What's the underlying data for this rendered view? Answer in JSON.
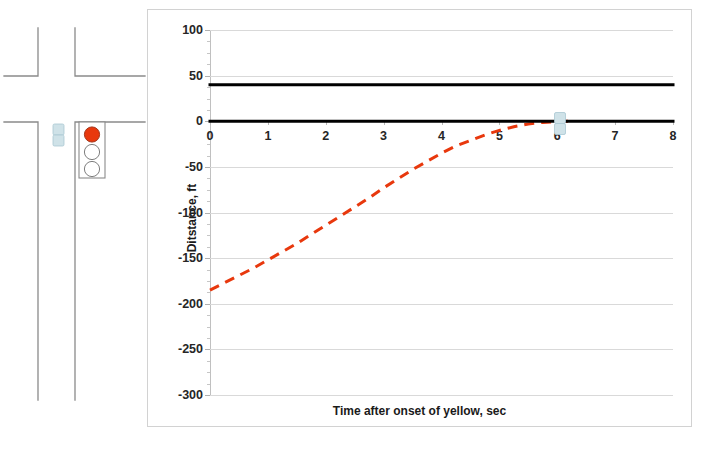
{
  "scene": {
    "name": "signalized-intersection-sketch",
    "signal": {
      "name": "traffic-signal-head",
      "lamps": [
        {
          "name": "red-lamp",
          "state": "on",
          "color": "#E8380D"
        },
        {
          "name": "yellow-lamp",
          "state": "off",
          "color": "#ffffff"
        },
        {
          "name": "green-lamp",
          "state": "off",
          "color": "#ffffff"
        }
      ]
    },
    "vehicles": [
      {
        "name": "vehicle-at-stop-line",
        "color": "#BFD9E0"
      }
    ],
    "road_color": "#8a8a8a"
  },
  "chart_data": {
    "type": "line",
    "title": "",
    "xlabel": "Time after onset of yellow, sec",
    "ylabel": "Ditstance, ft",
    "xlim": [
      0,
      8
    ],
    "ylim": [
      -300,
      100
    ],
    "xticks": [
      "0",
      "1",
      "2",
      "3",
      "4",
      "5",
      "6",
      "7",
      "8"
    ],
    "yticks": [
      "100",
      "50",
      "0",
      "-50",
      "-100",
      "-150",
      "-200",
      "-250",
      "-300"
    ],
    "grid": true,
    "legend": "none",
    "series": [
      {
        "name": "vehicle-trajectory",
        "style": "dashed",
        "color": "#E8380D",
        "width": 3,
        "x": [
          0,
          0.25,
          0.5,
          0.75,
          1,
          1.25,
          1.5,
          1.75,
          2,
          2.25,
          2.5,
          2.75,
          3,
          3.25,
          3.5,
          3.75,
          4,
          4.25,
          4.5,
          4.75,
          5,
          5.25,
          5.5,
          5.75,
          6,
          6.25
        ],
        "values": [
          -185,
          -177,
          -169,
          -161,
          -152,
          -143,
          -134,
          -124,
          -114,
          -104,
          -94,
          -84,
          -73,
          -63,
          -53,
          -44,
          -35,
          -27,
          -21,
          -15,
          -10,
          -6,
          -3,
          -1.3,
          -0.3,
          0
        ]
      },
      {
        "name": "stop-line-reference",
        "style": "solid",
        "color": "#000000",
        "width": 3,
        "x": [
          0,
          8
        ],
        "values": [
          0,
          0
        ]
      },
      {
        "name": "far-side-reference",
        "style": "solid",
        "color": "#000000",
        "width": 3,
        "x": [
          0,
          8
        ],
        "values": [
          40,
          40
        ]
      }
    ]
  }
}
